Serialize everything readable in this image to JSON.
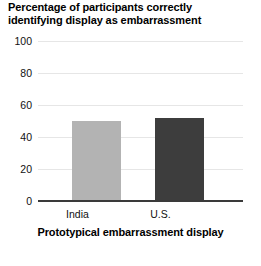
{
  "chart_data": {
    "type": "bar",
    "title": "Percentage of participants correctly identifying display as embarrassment",
    "title_line_1": "Percentage of participants correctly",
    "title_line_2": "identifying display as embarrassment",
    "xlabel": "Prototypical embarrassment display",
    "ylabel": "",
    "categories": [
      "India",
      "U.S."
    ],
    "values": [
      50,
      52
    ],
    "ylim": [
      0,
      100
    ],
    "yticks": [
      0,
      20,
      40,
      60,
      80,
      100
    ],
    "ytick_labels": [
      "0",
      "20",
      "40",
      "60",
      "80",
      "100"
    ],
    "grid": "horizontal",
    "legend": "none",
    "bar_colors": [
      "#b3b3b3",
      "#3d3d3d"
    ],
    "gridline_color": "#e6e6e6",
    "axis_color": "#3a3a3a",
    "background_color": "#ffffff"
  }
}
